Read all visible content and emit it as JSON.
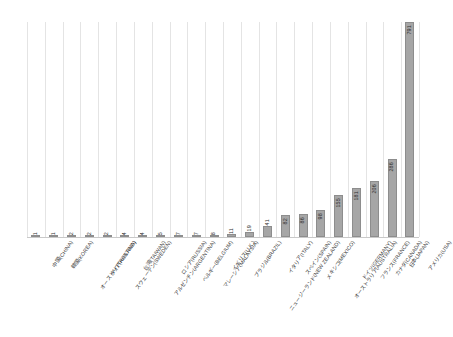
{
  "chart_data": {
    "type": "bar",
    "title": "",
    "subtitle": "",
    "xlabel": "",
    "ylabel": "",
    "ylim": [
      0,
      791
    ],
    "grid": "vertical",
    "legend": "none",
    "orientation": "vertical",
    "bar_color": "#a6a6a6",
    "bar_border_color": "#8d8d8d",
    "gridline_color": "#e4e4e4",
    "axis_color": "#c9c9c9",
    "label_rotation_deg": -55,
    "value_label_rotation_deg": -90,
    "categories": [
      "中国(CHINA)",
      "韓国(KOREA)",
      "オーストリア(AUSTRIA)",
      "タイ(THAILAND)",
      "スウェーデン(SWEDEN)",
      "台湾(TAIWAN)",
      "アルゼンチン(ARGENTINA)",
      "ロシア(RUSSIA)",
      "ベルギー(BELGIUM)",
      "マレーシア(MALAYSIA)",
      "イギリス(U.K.)",
      "ブラジル(BRAZIL)",
      "ニュージーランド(NEW ZEALAND)",
      "イタリア(ITALY)",
      "スペイン(SPAIN)",
      "メキシコ(MEXICO)",
      "オーストラリア(AUSTRALIA)",
      "ドイツ(GERMANY)",
      "フランス(FRANCE)",
      "カナダ(CANADA)",
      "日本(JAPAN)",
      "アメリカ(USA)"
    ],
    "values": [
      1,
      1,
      2,
      2,
      2,
      4,
      4,
      5,
      7,
      7,
      8,
      11,
      19,
      41,
      82,
      86,
      98,
      155,
      181,
      206,
      286,
      791
    ],
    "value_labels": [
      "1",
      "1",
      "2",
      "2",
      "2",
      "4",
      "4",
      "5",
      "7",
      "7",
      "8",
      "11",
      "19",
      "41",
      "82",
      "86",
      "98",
      "155",
      "181",
      "206",
      "286",
      "791"
    ]
  }
}
